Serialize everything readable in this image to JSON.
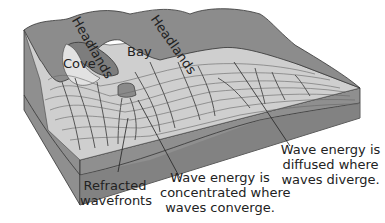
{
  "diagram": {
    "type": "coastal wave refraction block diagram",
    "labels": {
      "headlands_left": "Headlands",
      "headlands_right": "Headlands",
      "bay": "Bay",
      "cove": "Cove",
      "refracted_line1": "Refracted",
      "refracted_line2": "wavefronts",
      "converge_line1": "Wave energy is",
      "converge_line2": "concentrated where",
      "converge_line3": "waves converge.",
      "diverge_line1": "Wave energy is",
      "diverge_line2": "diffused where",
      "diverge_line3": "waves diverge."
    },
    "colors": {
      "land": "#8a8a8a",
      "land_dark": "#6e6e6e",
      "water": "#c9c9c9",
      "water_light": "#dcdcdc",
      "block_side": "#8f8f8f",
      "block_bottom": "#777777",
      "lines": "#555555"
    }
  }
}
